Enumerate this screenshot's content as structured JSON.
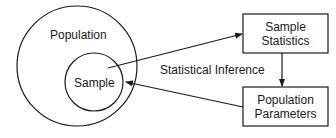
{
  "diagram": {
    "population_label": "Population",
    "sample_label": "Sample",
    "sample_statistics": [
      "Sample",
      "Statistics"
    ],
    "population_parameters": [
      "Population",
      "Parameters"
    ],
    "inference_label": "Statistical Inference",
    "line_color": "#1a1a1a"
  }
}
